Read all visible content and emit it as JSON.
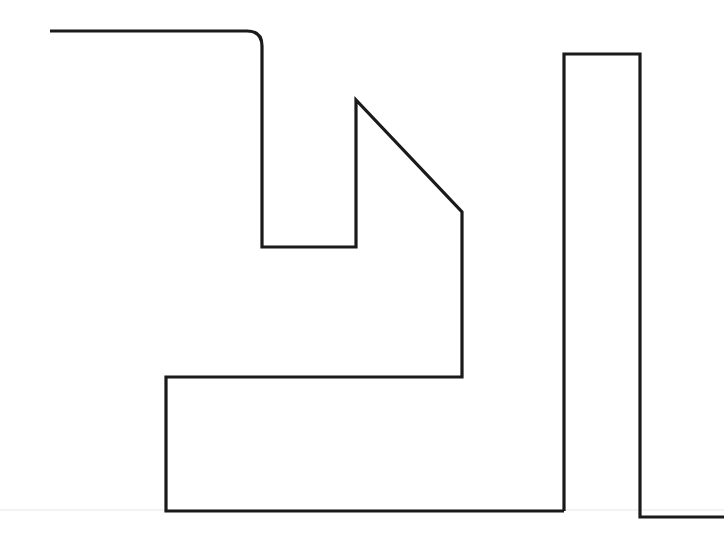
{
  "canvas": {
    "width": 724,
    "height": 541,
    "background_color": "#ffffff",
    "title": "abstract-line-drawing"
  },
  "style": {
    "stroke_color": "#1a1a1a",
    "stroke_width": 3.2,
    "stroke_linecap": "butt",
    "stroke_linejoin": "miter",
    "fill": "none",
    "baseline_color": "#e8e8e8",
    "baseline_width": 1.2
  },
  "shapes": {
    "baseline": {
      "name": "horizon-baseline",
      "d": "M 0 510 L 724 510"
    },
    "main_outline": {
      "name": "main-outline-path",
      "description": "continuous polyline: top rail, rounded corner, descending stem, U notch, peaked roof with diagonal, lower block, foot",
      "d": "M 50 31 L 247 31 Q 262 31 262 46 L 262 247 L 356 247 L 356 100 L 462 212 L 462 377 L 166 377 L 166 511 L 564 511"
    },
    "tower": {
      "name": "tower-outline-path",
      "description": "tall narrow rectangle open at bottom, right leg turns out to the right edge",
      "d": "M 564 511 L 564 54 L 640 54 L 640 517 L 724 517"
    }
  },
  "vertices": {
    "top_rail_start": [
      50,
      31
    ],
    "rounded_corner": [
      262,
      46
    ],
    "notch_bottom_left": [
      262,
      247
    ],
    "notch_bottom_right": [
      356,
      247
    ],
    "roof_apex": [
      356,
      100
    ],
    "roof_eave": [
      462,
      212
    ],
    "block_top_right": [
      462,
      377
    ],
    "block_top_left": [
      166,
      377
    ],
    "block_bottom_left": [
      166,
      511
    ],
    "block_bottom_right": [
      564,
      511
    ],
    "tower_top_left": [
      564,
      54
    ],
    "tower_top_right": [
      640,
      54
    ],
    "tower_bottom_right": [
      640,
      517
    ],
    "foot_end": [
      724,
      517
    ]
  },
  "corner_radius": 15
}
